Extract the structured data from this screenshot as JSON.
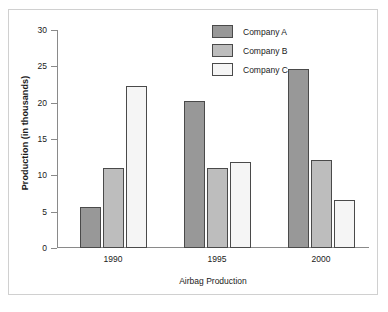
{
  "chart_data": {
    "type": "bar",
    "title": "",
    "xlabel": "Airbag Production",
    "ylabel": "Production (in thousands)",
    "categories": [
      "1990",
      "1995",
      "2000"
    ],
    "series": [
      {
        "name": "Company A",
        "color": "#989898",
        "values": [
          5.7,
          20.3,
          24.6
        ]
      },
      {
        "name": "Company B",
        "color": "#bdbdbd",
        "values": [
          11.0,
          11.0,
          12.1
        ]
      },
      {
        "name": "Company C",
        "color": "#f5f5f5",
        "values": [
          22.3,
          11.9,
          6.6
        ]
      }
    ],
    "ylim": [
      0,
      30
    ],
    "yticks": [
      0,
      5,
      10,
      15,
      20,
      25,
      30
    ],
    "ytick_labels": [
      "0",
      "5",
      "10",
      "15",
      "20",
      "25",
      "30"
    ],
    "grid": false,
    "legend_position": "top-right"
  }
}
